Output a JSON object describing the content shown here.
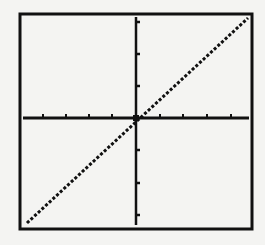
{
  "colors": {
    "background": "#f4f4f2",
    "ink": "#111111"
  },
  "chart_data": {
    "type": "line",
    "title": "",
    "xlabel": "",
    "ylabel": "",
    "function": "y = x",
    "xlim": [
      -10,
      10
    ],
    "ylim": [
      -10,
      10
    ],
    "x_ticks": [
      -8,
      -6,
      -4,
      -2,
      2,
      4,
      6,
      8
    ],
    "y_ticks": [
      -9,
      -6,
      -3,
      3,
      6,
      9
    ],
    "grid": false,
    "legend": null,
    "series": [
      {
        "name": "y=x",
        "x": [
          -10,
          -5,
          0,
          5,
          10
        ],
        "y": [
          -10,
          -5,
          0,
          5,
          10
        ],
        "style": "dotted"
      }
    ]
  },
  "layout": {
    "frame": {
      "x1": 20,
      "y1": 14,
      "x2": 252,
      "y2": 229
    },
    "origin": {
      "x": 136,
      "y": 118
    },
    "x_axis": {
      "x1": 23,
      "x2": 249
    },
    "y_axis": {
      "y1": 17,
      "y2": 225
    },
    "x_tick_px": [
      43,
      66,
      89,
      112,
      160,
      183,
      207,
      231
    ],
    "y_tick_px": [
      22,
      54,
      86,
      150,
      183,
      215
    ],
    "line": {
      "x1": 27,
      "y1": 223,
      "x2": 248,
      "y2": 18
    }
  }
}
